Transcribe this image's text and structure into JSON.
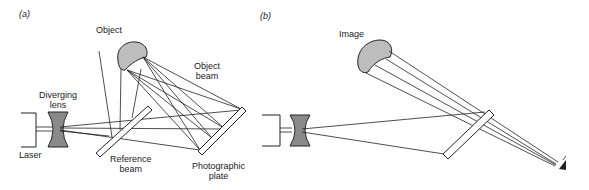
{
  "panels": {
    "a": {
      "label": "(a)",
      "labels": {
        "object": "Object",
        "object_beam_1": "Object",
        "object_beam_2": "beam",
        "diverging_lens_1": "Diverging",
        "diverging_lens_2": "lens",
        "laser": "Laser",
        "reference_beam_1": "Reference",
        "reference_beam_2": "beam",
        "photographic_plate_1": "Photographic",
        "photographic_plate_2": "plate"
      }
    },
    "b": {
      "label": "(b)",
      "labels": {
        "image": "Image"
      }
    }
  },
  "colors": {
    "line": "#222222",
    "object_fill": "#bdbdbd",
    "lens_fill": "#8a8a8a"
  }
}
